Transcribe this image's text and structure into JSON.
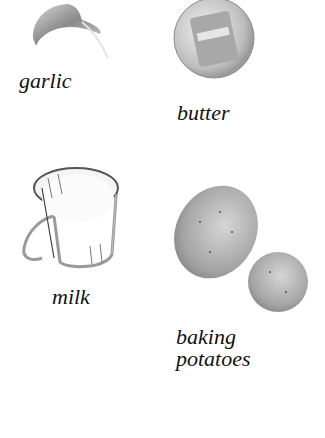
{
  "ingredients": [
    {
      "id": "garlic",
      "label": "garlic"
    },
    {
      "id": "butter",
      "label": "butter"
    },
    {
      "id": "milk",
      "label": "milk"
    },
    {
      "id": "potatoes",
      "label_line1": "baking",
      "label_line2": "potatoes"
    }
  ]
}
